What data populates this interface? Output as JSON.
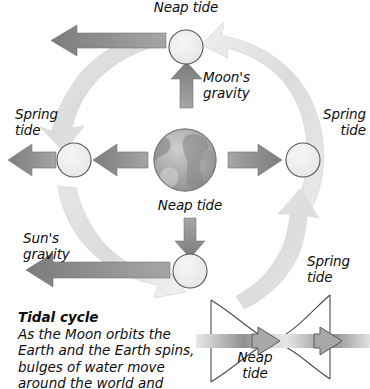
{
  "figure": {
    "title": "Tidal cycle",
    "body_text": "As the Moon orbits the Earth and the Earth spins, bulges of water move around the world and",
    "background_color": "#ffffff",
    "text_color": "#0d0d0d"
  },
  "colors": {
    "dark_arrow": "#8d8d8d",
    "dark_arrow_edge": "#6f6f6f",
    "orbit_arrow": "#dedede",
    "orbit_arrow_edge": "#cfcfcf",
    "moon_fill": "#eeeeee",
    "moon_edge": "#5a5a5a",
    "earth_fill": "#a9a9a9",
    "inset_line": "#4a4a4a"
  },
  "labels": {
    "neap_top": "Neap tide",
    "neap_bottom": "Neap tide",
    "spring_left": "Spring\ntide",
    "spring_right": "Spring\ntide",
    "spring_inset": "Spring\ntide",
    "neap_inset": "Neap\ntide",
    "moons_gravity": "Moon's\ngravity",
    "suns_gravity": "Sun's\ngravity"
  },
  "bodies": {
    "earth": {
      "name": "Earth",
      "cx": 185,
      "cy": 160,
      "r": 31
    },
    "moons": [
      {
        "position": "top",
        "phase_label": "Neap tide",
        "cx": 186,
        "cy": 47,
        "r": 17
      },
      {
        "position": "left",
        "phase_label": "Spring tide",
        "cx": 74,
        "cy": 160,
        "r": 17
      },
      {
        "position": "right",
        "phase_label": "Spring tide",
        "cx": 303,
        "cy": 160,
        "r": 17
      },
      {
        "position": "bottom",
        "phase_label": "Neap tide",
        "cx": 190,
        "cy": 271,
        "r": 17
      }
    ]
  },
  "force_arrows": [
    {
      "name": "moon-gravity-up-arrow",
      "direction": "up",
      "label": "Moon's gravity"
    },
    {
      "name": "neap-down-arrow",
      "direction": "down",
      "label": "Neap tide"
    },
    {
      "name": "sun-gravity-left-arrow",
      "direction": "left",
      "label": "Sun's gravity"
    },
    {
      "name": "top-left-outward-arrow",
      "direction": "left",
      "label": ""
    },
    {
      "name": "left-outward-arrow",
      "direction": "left",
      "label": "Spring tide"
    },
    {
      "name": "earth-to-left-moon-arrow",
      "direction": "left",
      "label": ""
    },
    {
      "name": "earth-to-right-moon-arrow",
      "direction": "right",
      "label": "Spring tide"
    }
  ],
  "orbit": {
    "name": "moon-orbit-path",
    "description": "two thick light-grey curved arrows showing the Moon orbiting the Earth",
    "direction": "counter-clockwise"
  },
  "inset": {
    "name": "tidal-bulge-inset",
    "description": "hourglass-shaped water bulge profile with horizontal flow arrows",
    "labels": {
      "top_right": "Spring\ntide",
      "bottom_center": "Neap\ntide"
    }
  }
}
